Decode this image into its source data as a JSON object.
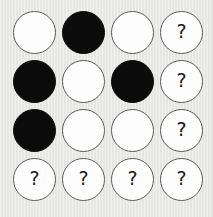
{
  "board": {
    "title": "Circle Grid Puzzle",
    "columns": 4,
    "rows": 4,
    "background_color": "#e8e8e6",
    "token_white_color": "#fdfdfd",
    "token_black_color": "#0b0b0b",
    "token_border_color": "#5a5a5a",
    "unknown_label": "?",
    "legend": {
      "white": "white-token",
      "black": "black-token",
      "unknown": "unknown-token"
    },
    "cells": [
      [
        {
          "state": "white",
          "label": ""
        },
        {
          "state": "black",
          "label": ""
        },
        {
          "state": "white",
          "label": ""
        },
        {
          "state": "unknown",
          "label": "?"
        }
      ],
      [
        {
          "state": "black",
          "label": ""
        },
        {
          "state": "white",
          "label": ""
        },
        {
          "state": "black",
          "label": ""
        },
        {
          "state": "unknown",
          "label": "?"
        }
      ],
      [
        {
          "state": "black",
          "label": ""
        },
        {
          "state": "white",
          "label": ""
        },
        {
          "state": "white",
          "label": ""
        },
        {
          "state": "unknown",
          "label": "?"
        }
      ],
      [
        {
          "state": "unknown",
          "label": "?"
        },
        {
          "state": "unknown",
          "label": "?"
        },
        {
          "state": "unknown",
          "label": "?"
        },
        {
          "state": "unknown",
          "label": "?"
        }
      ]
    ]
  }
}
